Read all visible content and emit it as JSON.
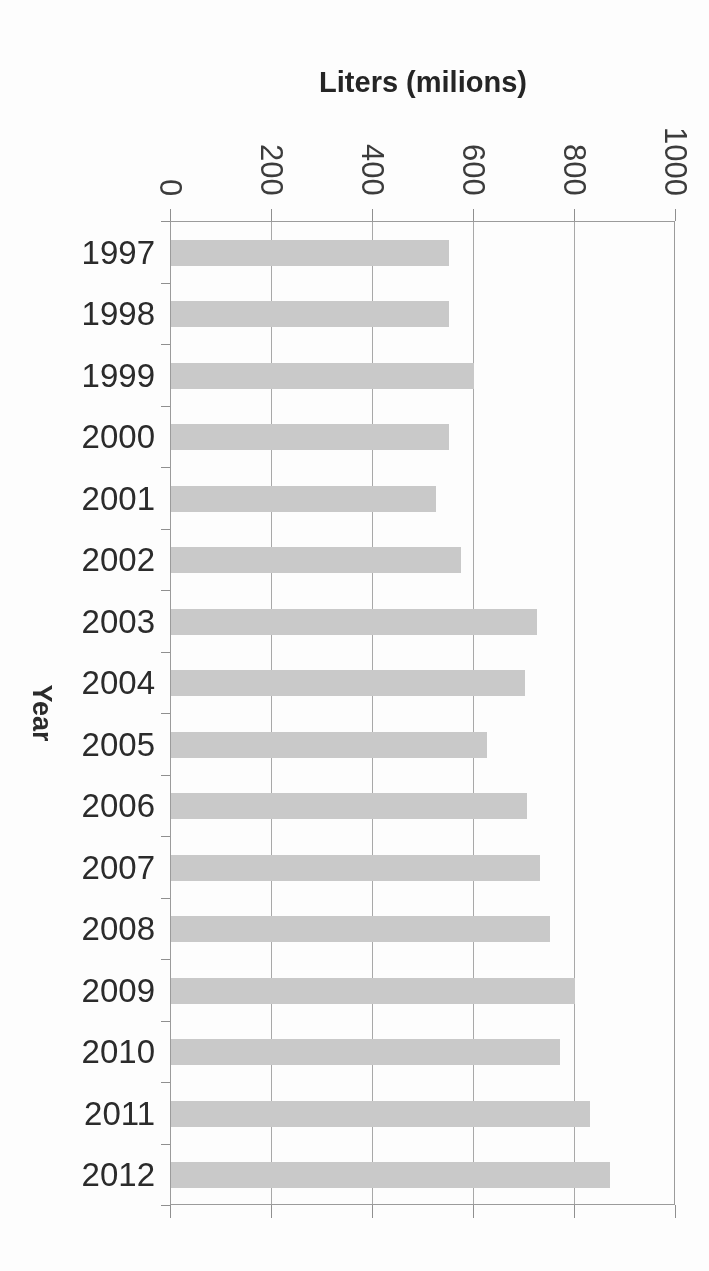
{
  "chart_data": {
    "type": "bar",
    "orientation": "horizontal",
    "title": "Liters (milions)",
    "xlabel": "Liters (milions)",
    "ylabel": "Year",
    "categories": [
      "1997",
      "1998",
      "1999",
      "2000",
      "2001",
      "2002",
      "2003",
      "2004",
      "2005",
      "2006",
      "2007",
      "2008",
      "2009",
      "2010",
      "2011",
      "2012"
    ],
    "values": [
      550,
      550,
      600,
      550,
      525,
      575,
      725,
      700,
      625,
      705,
      730,
      750,
      800,
      770,
      830,
      870
    ],
    "x_ticks": [
      "0",
      "200",
      "400",
      "600",
      "800",
      "1000"
    ],
    "x_tick_values": [
      0,
      200,
      400,
      600,
      800,
      1000
    ],
    "xlim": [
      0,
      1000
    ],
    "grid": true,
    "legend": false,
    "bar_color": "#c9c9c9",
    "gridline_color": "#a8a8a8",
    "axis_color": "#9b9b9b",
    "text_color": "#2b2b2b"
  }
}
